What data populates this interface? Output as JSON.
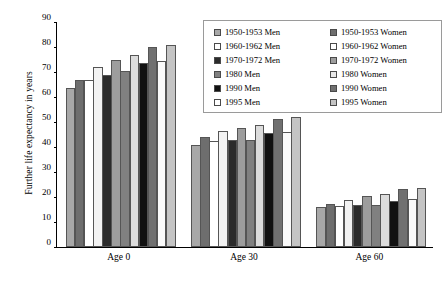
{
  "chart_data": {
    "type": "bar",
    "title": "",
    "xlabel": "",
    "ylabel": "Further life expectancy in years",
    "ylim": [
      0,
      90
    ],
    "yticks": [
      0,
      10,
      20,
      30,
      40,
      50,
      60,
      70,
      80,
      90
    ],
    "grid": false,
    "legend_position": "top-right",
    "categories": [
      "Age 0",
      "Age 30",
      "Age 60"
    ],
    "series": [
      {
        "name": "1950-1953 Men",
        "color": "#a8a8a8",
        "values": [
          63.5,
          41.0,
          16.0
        ]
      },
      {
        "name": "1950-1953 Women",
        "color": "#6e6e6e",
        "values": [
          67.0,
          44.0,
          17.4
        ]
      },
      {
        "name": "1960-1962 Men",
        "color": "#ffffff",
        "values": [
          67.0,
          42.5,
          16.5
        ]
      },
      {
        "name": "1960-1962 Women",
        "color": "#f2f2f2",
        "values": [
          72.0,
          46.5,
          19.0
        ]
      },
      {
        "name": "1970-1972 Men",
        "color": "#2b2b2b",
        "values": [
          69.0,
          42.7,
          17.0
        ]
      },
      {
        "name": "1970-1972 Women",
        "color": "#9d9d9d",
        "values": [
          75.0,
          47.8,
          20.3
        ]
      },
      {
        "name": "1980 Men",
        "color": "#808080",
        "values": [
          70.5,
          43.0,
          17.0
        ]
      },
      {
        "name": "1980 Women",
        "color": "#dcdcdc",
        "values": [
          77.0,
          49.0,
          21.4
        ]
      },
      {
        "name": "1990 Men",
        "color": "#111111",
        "values": [
          73.5,
          45.5,
          18.4
        ]
      },
      {
        "name": "1990 Women",
        "color": "#707070",
        "values": [
          80.0,
          51.3,
          23.2
        ]
      },
      {
        "name": "1995 Men",
        "color": "#fafafa",
        "values": [
          74.5,
          46.2,
          19.3
        ]
      },
      {
        "name": "1995 Women",
        "color": "#c4c4c4",
        "values": [
          81.0,
          52.0,
          23.8
        ]
      }
    ]
  },
  "legend": {
    "items": [
      {
        "label": "1950-1953 Men",
        "color": "#a8a8a8"
      },
      {
        "label": "1950-1953 Women",
        "color": "#6e6e6e"
      },
      {
        "label": "1960-1962 Men",
        "color": "#ffffff"
      },
      {
        "label": "1960-1962 Women",
        "color": "#ffffff"
      },
      {
        "label": "1970-1972 Men",
        "color": "#2b2b2b"
      },
      {
        "label": "1970-1972 Women",
        "color": "#9d9d9d"
      },
      {
        "label": "1980 Men",
        "color": "#808080"
      },
      {
        "label": "1980 Women",
        "color": "#e8e8e8"
      },
      {
        "label": "1990 Men",
        "color": "#111111"
      },
      {
        "label": "1990 Women",
        "color": "#707070"
      },
      {
        "label": "1995 Men",
        "color": "#ffffff"
      },
      {
        "label": "1995 Women",
        "color": "#c4c4c4"
      }
    ]
  }
}
